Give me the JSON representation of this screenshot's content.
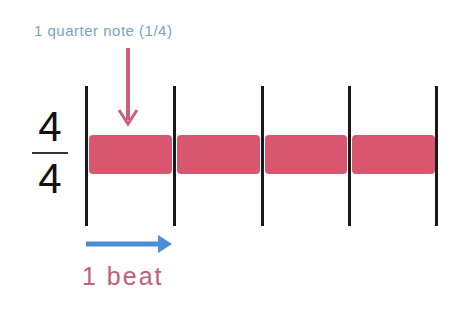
{
  "annotation_top": {
    "text": "1 quarter note (1/4)",
    "color": "#7aa3bf"
  },
  "annotation_bottom": {
    "text": "1 beat",
    "color": "#c0607a"
  },
  "time_signature": {
    "numerator": "4",
    "denominator": "4"
  },
  "colors": {
    "note_bar": "#d9566f",
    "down_arrow": "#c9617a",
    "beat_arrow": "#4a8fd6",
    "barline": "#1a1a1a"
  },
  "measure": {
    "barlines_x": [
      86,
      174,
      262,
      349,
      436
    ],
    "segments": [
      {
        "x": 89,
        "w": 83
      },
      {
        "x": 177,
        "w": 83
      },
      {
        "x": 265,
        "w": 82
      },
      {
        "x": 352,
        "w": 83
      }
    ]
  }
}
